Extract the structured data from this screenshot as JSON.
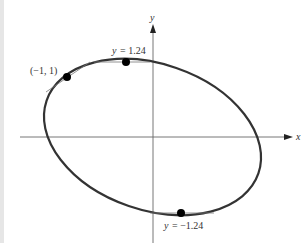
{
  "figure": {
    "axes": {
      "x_label": "x",
      "y_label": "y"
    },
    "curve": {
      "type": "tilted-ellipse",
      "color": "#333333"
    },
    "points": [
      {
        "id": "point-neg1-1",
        "label": "(−1, 1)"
      },
      {
        "id": "point-top",
        "label_var": "y",
        "label_eq": "= 1.24"
      },
      {
        "id": "point-bottom",
        "label_var": "y",
        "label_eq": "= −1.24"
      }
    ],
    "colors": {
      "axis": "#555555",
      "curve": "#333333",
      "point": "#000000",
      "tangent": "#777777",
      "strip": "#e6e6e6"
    }
  }
}
